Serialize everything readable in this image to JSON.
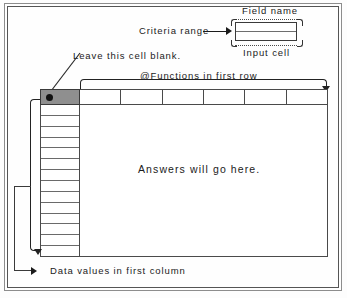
{
  "figure": {
    "labels": {
      "field_name": "Field name",
      "input_cell": "Input cell",
      "criteria_range": "Criteria range",
      "leave_blank": "Leave this cell blank.",
      "functions_first_row": "@Functions in first row",
      "answers": "Answers will go here.",
      "data_values": "Data values in first column"
    },
    "colors": {
      "corner_cell_fill": "#8f8f8f",
      "line": "#4a4a4a",
      "text": "#1b1b1b",
      "background": "#ffffff"
    },
    "table": {
      "header_cells": [
        "",
        "",
        "",
        "",
        "",
        ""
      ],
      "first_column_cells": [
        "",
        "",
        "",
        "",
        "",
        "",
        "",
        "",
        "",
        "",
        "",
        "",
        "",
        ""
      ],
      "corner_cell_value": ""
    },
    "criteria_box": {
      "rows": [
        "",
        ""
      ]
    }
  }
}
